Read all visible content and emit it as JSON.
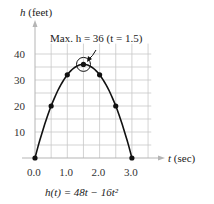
{
  "chart_data": {
    "type": "line",
    "title": "",
    "ylabel_var": "h",
    "ylabel_unit": "(feet)",
    "xlabel_var": "t",
    "xlabel_unit": "(sec)",
    "formula": "h(t) = 48t − 16t²",
    "annotation": "Max. h = 36 (t = 1.5)",
    "x_ticks": [
      "0.0",
      "1.0",
      "2.0",
      "3.0"
    ],
    "y_ticks": [
      "10",
      "20",
      "30",
      "40"
    ],
    "xlim": [
      0,
      3.6
    ],
    "ylim": [
      0,
      45
    ],
    "grid": true,
    "points": [
      {
        "t": 0.0,
        "h": 0
      },
      {
        "t": 0.5,
        "h": 20
      },
      {
        "t": 1.0,
        "h": 32
      },
      {
        "t": 1.5,
        "h": 36
      },
      {
        "t": 2.0,
        "h": 32
      },
      {
        "t": 2.5,
        "h": 20
      },
      {
        "t": 3.0,
        "h": 0
      }
    ],
    "curve_color": "#111111",
    "grid_color": "#c8c8c8",
    "axis_color": "#b0b0b0"
  }
}
